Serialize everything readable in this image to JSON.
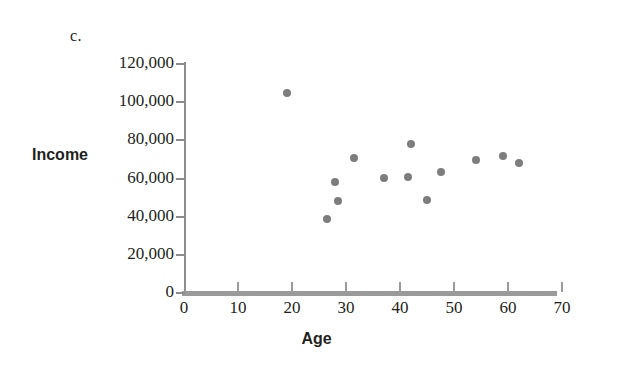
{
  "panel": {
    "label": "c."
  },
  "chart_data": {
    "type": "scatter",
    "title": "",
    "xlabel": "Age",
    "ylabel": "Income",
    "xlim": [
      0,
      74
    ],
    "ylim": [
      0,
      124000
    ],
    "grid": false,
    "legend": null,
    "point_color": "#7d7d7d",
    "axis_color": "#9a9a9a",
    "xticks": [
      0,
      10,
      20,
      30,
      40,
      50,
      60,
      70
    ],
    "xtick_labels": [
      "0",
      "10",
      "20",
      "30",
      "40",
      "50",
      "60",
      "70"
    ],
    "yticks": [
      0,
      20000,
      40000,
      60000,
      80000,
      100000,
      120000
    ],
    "ytick_labels": [
      "0",
      "20,000",
      "40,000",
      "60,000",
      "80,000",
      "100,000",
      "120,000"
    ],
    "x": [
      19,
      26.5,
      28,
      28.5,
      31.5,
      37,
      42,
      41.5,
      45,
      47.5,
      54,
      59,
      62
    ],
    "y": [
      105000,
      39000,
      58000,
      48000,
      71000,
      60500,
      78000,
      61000,
      48500,
      63500,
      69500,
      72000,
      68000
    ],
    "points": [
      {
        "age": 19,
        "income": 105000
      },
      {
        "age": 26.5,
        "income": 39000
      },
      {
        "age": 28,
        "income": 58000
      },
      {
        "age": 28.5,
        "income": 48000
      },
      {
        "age": 31.5,
        "income": 71000
      },
      {
        "age": 37,
        "income": 60500
      },
      {
        "age": 42,
        "income": 78000
      },
      {
        "age": 41.5,
        "income": 61000
      },
      {
        "age": 45,
        "income": 48500
      },
      {
        "age": 47.5,
        "income": 63500
      },
      {
        "age": 54,
        "income": 69500
      },
      {
        "age": 59,
        "income": 72000
      },
      {
        "age": 62,
        "income": 68000
      }
    ]
  }
}
